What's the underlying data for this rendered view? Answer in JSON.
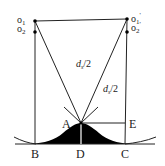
{
  "diagram": {
    "type": "geometry-construction",
    "colors": {
      "line": "#222222",
      "fill": "#000000",
      "background": "#ffffff"
    },
    "points": {
      "o1": {
        "label": "o",
        "sub": "1",
        "sup": ""
      },
      "o2": {
        "label": "o",
        "sub": "2",
        "sup": ""
      },
      "o1p": {
        "label": "o",
        "sub": "1",
        "sup": "'"
      },
      "o2p": {
        "label": "o",
        "sub": "2",
        "sup": "'"
      },
      "A": "A",
      "B": "B",
      "C": "C",
      "D": "D",
      "E": "E"
    },
    "segments": {
      "left_diag": {
        "main": "d",
        "sub": "s",
        "rest": "/2"
      },
      "right_diag": {
        "main": "d",
        "sub": "s",
        "rest": "/2"
      }
    }
  }
}
